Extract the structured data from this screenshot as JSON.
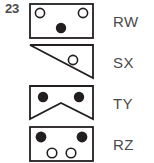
{
  "item": {
    "number": "23"
  },
  "colors": {
    "stroke": "#231f20",
    "fill_dot": "#231f20",
    "open_dot_fill": "#ffffff",
    "text": "#4a4a4a",
    "background": "#ffffff"
  },
  "figures": [
    {
      "id": "figure-rw",
      "label": "RW",
      "shape": "rectangle",
      "description": "rectangle with two open circles at upper corners and one filled dot at bottom center",
      "markers": [
        {
          "type": "open-circle",
          "cx": 11,
          "cy": 10
        },
        {
          "type": "open-circle",
          "cx": 54,
          "cy": 10
        },
        {
          "type": "filled-dot",
          "cx": 32,
          "cy": 25
        }
      ]
    },
    {
      "id": "figure-sx",
      "label": "SX",
      "shape": "right-triangle",
      "description": "right triangle with flat top edge, vertical right edge and hypotenuse running from top-left to bottom-right, containing one open circle",
      "markers": [
        {
          "type": "open-circle",
          "cx": 44,
          "cy": 16
        }
      ]
    },
    {
      "id": "figure-ty",
      "label": "TY",
      "shape": "chevron",
      "description": "rectangle with a V-notch cut into the bottom edge, two filled dots near the top",
      "markers": [
        {
          "type": "filled-dot",
          "cx": 14,
          "cy": 12
        },
        {
          "type": "filled-dot",
          "cx": 50,
          "cy": 12
        }
      ]
    },
    {
      "id": "figure-rz",
      "label": "RZ",
      "shape": "rectangle",
      "description": "rectangle with two filled dots in the upper corners and two open circles below them",
      "markers": [
        {
          "type": "filled-dot",
          "cx": 12,
          "cy": 11
        },
        {
          "type": "filled-dot",
          "cx": 53,
          "cy": 11
        },
        {
          "type": "open-circle",
          "cx": 23,
          "cy": 27
        },
        {
          "type": "open-circle",
          "cx": 42,
          "cy": 27
        }
      ]
    }
  ]
}
